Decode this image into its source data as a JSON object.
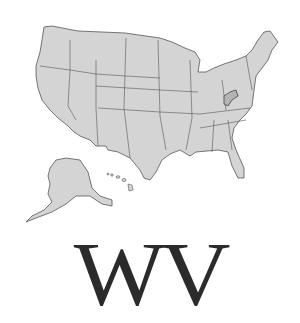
{
  "map": {
    "subject": "United States map",
    "highlighted_state": "West Virginia",
    "fill_color": "#d4d4d4",
    "highlight_color": "#b4b4b4",
    "border_color": "#555555"
  },
  "label": {
    "text": "WV"
  }
}
